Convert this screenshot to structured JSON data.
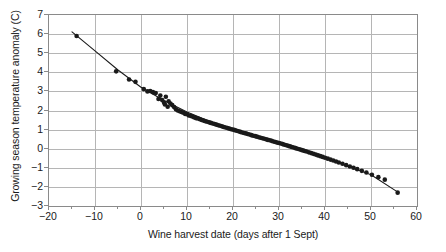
{
  "chart_data": {
    "type": "scatter",
    "title": "",
    "xlabel": "Wine harvest date (days after 1 Sept)",
    "ylabel": "Growing season temperature anomaly (C)",
    "xlim": [
      -20,
      60
    ],
    "ylim": [
      -3,
      7
    ],
    "xticks": [
      -20,
      -10,
      0,
      10,
      20,
      30,
      40,
      50,
      60
    ],
    "xticklabels": [
      "−20",
      "−10",
      "0",
      "10",
      "20",
      "30",
      "40",
      "50",
      "60"
    ],
    "yticks": [
      -3,
      -2,
      -1,
      0,
      1,
      2,
      3,
      4,
      5,
      6,
      7
    ],
    "yticklabels": [
      "−3",
      "−2",
      "−1",
      "0",
      "1",
      "2",
      "3",
      "4",
      "5",
      "6",
      "7"
    ],
    "grid": true,
    "grid_color": "#b5b5b5",
    "legend": "none",
    "marker_color": "#1a1a1a",
    "line_color": "#1a1a1a",
    "marker_size": 2.3,
    "series": [
      {
        "name": "Wine harvest observations",
        "kind": "scatter",
        "points": [
          [
            -14.0,
            5.9
          ],
          [
            -5.4,
            4.05
          ],
          [
            -2.6,
            3.62
          ],
          [
            -1.2,
            3.5
          ],
          [
            0.6,
            3.12
          ],
          [
            1.4,
            3.0
          ],
          [
            2.0,
            3.02
          ],
          [
            2.6,
            2.96
          ],
          [
            3.2,
            2.92
          ],
          [
            3.8,
            2.6
          ],
          [
            4.2,
            2.78
          ],
          [
            4.6,
            2.55
          ],
          [
            5.0,
            2.42
          ],
          [
            5.2,
            2.32
          ],
          [
            5.4,
            2.72
          ],
          [
            5.8,
            2.2
          ],
          [
            6.0,
            2.48
          ],
          [
            6.4,
            2.36
          ],
          [
            6.8,
            2.28
          ],
          [
            7.2,
            2.18
          ],
          [
            7.6,
            2.06
          ],
          [
            8.0,
            2.0
          ],
          [
            8.4,
            1.96
          ],
          [
            8.8,
            1.92
          ],
          [
            9.2,
            1.88
          ],
          [
            9.6,
            1.82
          ],
          [
            10.0,
            1.8
          ],
          [
            10.4,
            1.74
          ],
          [
            10.8,
            1.72
          ],
          [
            11.2,
            1.68
          ],
          [
            11.6,
            1.64
          ],
          [
            12.0,
            1.6
          ],
          [
            12.4,
            1.58
          ],
          [
            12.8,
            1.54
          ],
          [
            13.2,
            1.5
          ],
          [
            13.6,
            1.47
          ],
          [
            14.0,
            1.44
          ],
          [
            14.4,
            1.41
          ],
          [
            14.8,
            1.38
          ],
          [
            15.2,
            1.35
          ],
          [
            15.6,
            1.32
          ],
          [
            16.0,
            1.29
          ],
          [
            16.4,
            1.26
          ],
          [
            16.8,
            1.23
          ],
          [
            17.2,
            1.2
          ],
          [
            17.6,
            1.17
          ],
          [
            18.0,
            1.14
          ],
          [
            18.4,
            1.11
          ],
          [
            18.8,
            1.08
          ],
          [
            19.2,
            1.05
          ],
          [
            19.6,
            1.02
          ],
          [
            20.0,
            1.0
          ],
          [
            20.4,
            0.97
          ],
          [
            20.8,
            0.94
          ],
          [
            21.2,
            0.91
          ],
          [
            21.6,
            0.88
          ],
          [
            22.0,
            0.85
          ],
          [
            22.4,
            0.82
          ],
          [
            22.8,
            0.8
          ],
          [
            23.2,
            0.77
          ],
          [
            23.6,
            0.74
          ],
          [
            24.0,
            0.71
          ],
          [
            24.4,
            0.68
          ],
          [
            24.8,
            0.66
          ],
          [
            25.2,
            0.63
          ],
          [
            25.6,
            0.6
          ],
          [
            26.0,
            0.57
          ],
          [
            26.4,
            0.55
          ],
          [
            26.8,
            0.52
          ],
          [
            27.2,
            0.49
          ],
          [
            27.6,
            0.46
          ],
          [
            28.0,
            0.44
          ],
          [
            28.4,
            0.41
          ],
          [
            28.8,
            0.38
          ],
          [
            29.2,
            0.35
          ],
          [
            29.6,
            0.32
          ],
          [
            30.0,
            0.3
          ],
          [
            30.4,
            0.27
          ],
          [
            30.8,
            0.24
          ],
          [
            31.2,
            0.21
          ],
          [
            31.6,
            0.18
          ],
          [
            32.0,
            0.15
          ],
          [
            32.4,
            0.12
          ],
          [
            32.8,
            0.09
          ],
          [
            33.2,
            0.06
          ],
          [
            33.6,
            0.03
          ],
          [
            34.0,
            0.0
          ],
          [
            34.4,
            -0.03
          ],
          [
            34.8,
            -0.06
          ],
          [
            35.2,
            -0.09
          ],
          [
            35.6,
            -0.12
          ],
          [
            36.0,
            -0.15
          ],
          [
            36.5,
            -0.19
          ],
          [
            37.0,
            -0.23
          ],
          [
            37.5,
            -0.27
          ],
          [
            38.0,
            -0.31
          ],
          [
            38.5,
            -0.35
          ],
          [
            39.0,
            -0.39
          ],
          [
            39.5,
            -0.43
          ],
          [
            40.0,
            -0.47
          ],
          [
            40.6,
            -0.52
          ],
          [
            41.2,
            -0.57
          ],
          [
            41.8,
            -0.62
          ],
          [
            42.4,
            -0.67
          ],
          [
            43.0,
            -0.72
          ],
          [
            43.8,
            -0.79
          ],
          [
            44.6,
            -0.86
          ],
          [
            45.4,
            -0.93
          ],
          [
            46.2,
            -1.0
          ],
          [
            47.0,
            -1.07
          ],
          [
            48.0,
            -1.16
          ],
          [
            49.0,
            -1.25
          ],
          [
            50.2,
            -1.36
          ],
          [
            51.6,
            -1.49
          ],
          [
            53.0,
            -1.62
          ],
          [
            55.8,
            -2.3
          ]
        ]
      },
      {
        "name": "Fitted trend",
        "kind": "line",
        "points": [
          [
            -15.0,
            6.12
          ],
          [
            -10.0,
            5.12
          ],
          [
            -5.0,
            4.12
          ],
          [
            0.0,
            3.22
          ],
          [
            5.0,
            2.52
          ],
          [
            10.0,
            1.92
          ],
          [
            15.0,
            1.42
          ],
          [
            20.0,
            1.0
          ],
          [
            25.0,
            0.62
          ],
          [
            30.0,
            0.28
          ],
          [
            35.0,
            -0.08
          ],
          [
            40.0,
            -0.46
          ],
          [
            45.0,
            -0.92
          ],
          [
            50.0,
            -1.36
          ],
          [
            56.0,
            -2.3
          ]
        ]
      }
    ]
  }
}
